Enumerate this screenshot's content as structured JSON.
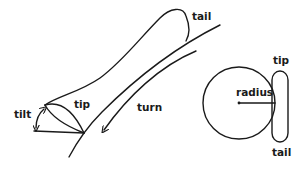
{
  "diagram": {
    "type": "illustration",
    "colors": {
      "stroke": "#1a1a1a",
      "background": "#ffffff"
    },
    "left_figure": {
      "description": "Elongated stroke shape resting on a curved path, with tilt angle and turn direction",
      "labels": {
        "tail": "tail",
        "tip": "tip",
        "turn": "turn",
        "tilt": "tilt"
      }
    },
    "right_figure": {
      "description": "Circle with radius line touching a vertical pill shape",
      "labels": {
        "tip": "tip",
        "radius": "radius",
        "tail": "tail"
      }
    }
  }
}
